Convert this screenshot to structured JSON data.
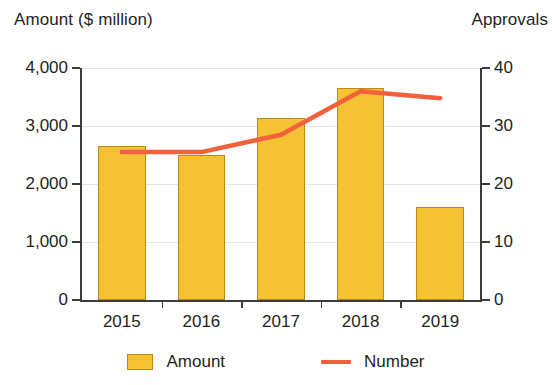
{
  "chart_data": {
    "type": "bar",
    "title": "",
    "subtitle": "",
    "categories": [
      "2015",
      "2016",
      "2017",
      "2018",
      "2019"
    ],
    "xlabel": "",
    "ylabel": "Amount ($ million)",
    "y2label": "Approvals",
    "ylim": [
      0,
      4000
    ],
    "y2lim": [
      0,
      40
    ],
    "yticks": [
      "0",
      "1,000",
      "2,000",
      "3,000",
      "4,000"
    ],
    "ytick_values": [
      0,
      1000,
      2000,
      3000,
      4000
    ],
    "y2ticks": [
      "0",
      "10",
      "20",
      "30",
      "40"
    ],
    "y2tick_values": [
      0,
      10,
      20,
      30,
      40
    ],
    "grid": true,
    "legend_position": "bottom",
    "series": [
      {
        "name": "Amount",
        "type": "bar",
        "axis": "left",
        "color": "#F5C135",
        "edge_color": "#B98A18",
        "values": [
          2650,
          2500,
          3140,
          3650,
          1610
        ]
      },
      {
        "name": "Number",
        "type": "line",
        "axis": "right",
        "color": "#F2603C",
        "values": [
          25.5,
          25.5,
          28.5,
          36.0,
          34.8
        ]
      }
    ]
  },
  "axes": {
    "left_title": "Amount ($ million)",
    "right_title": "Approvals"
  },
  "legend": {
    "items": [
      {
        "label": "Amount",
        "marker": "bar-swatch"
      },
      {
        "label": "Number",
        "marker": "line-swatch"
      }
    ]
  }
}
